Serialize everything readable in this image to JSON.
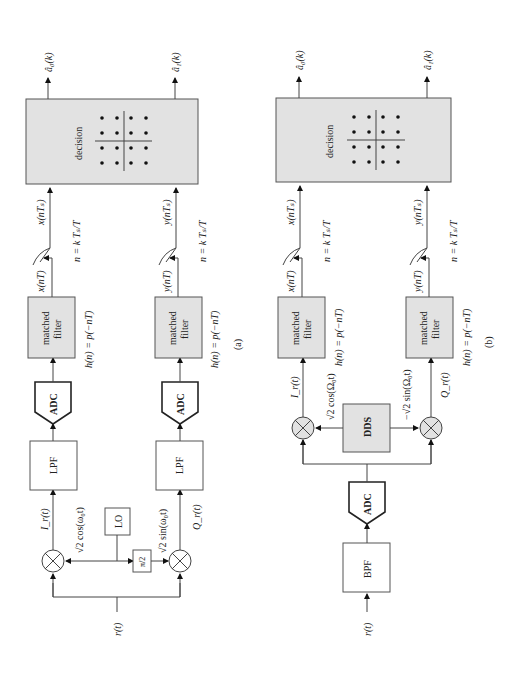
{
  "panel_a": {
    "caption": "(a)",
    "input_label": "r(t)",
    "blocks": {
      "lo": "LO",
      "phase_shift": "π/2",
      "lpf_i": "LPF",
      "lpf_q": "LPF",
      "adc_i": "ADC",
      "adc_q": "ADC",
      "mf_i_line1": "matched",
      "mf_i_line2": "filter",
      "mf_q_line1": "matched",
      "mf_q_line2": "filter",
      "decision": "decision"
    },
    "signals": {
      "i_baseband": "I_r(t)",
      "q_baseband": "Q_r(t)",
      "cos_carrier": "√2 cos(ω₀t)",
      "sin_carrier": "√2 sin(ω₀t)",
      "x_nT": "x(nT)",
      "y_nT": "y(nT)",
      "x_nTs": "x(nTₛ)",
      "y_nTs": "y(nTₛ)",
      "sample_rule_i": "n = k Tₛ/T",
      "sample_rule_q": "n = k Tₛ/T",
      "h_i": "h(n) = p(−nT)",
      "h_q": "h(n) = p(−nT)",
      "out_0": "â₀(k)",
      "out_1": "â₁(k)"
    }
  },
  "panel_b": {
    "caption": "(b)",
    "input_label": "r(t)",
    "blocks": {
      "bpf": "BPF",
      "adc": "ADC",
      "dds": "DDS",
      "mf_i_line1": "matched",
      "mf_i_line2": "filter",
      "mf_q_line1": "matched",
      "mf_q_line2": "filter",
      "decision": "decision"
    },
    "signals": {
      "i_baseband": "I_r(t)",
      "q_baseband": "Q_r(t)",
      "cos_carrier": "√2 cos(Ω₀t)",
      "sin_carrier": "−√2 sin(Ω₀t)",
      "x_nT": "x(nT)",
      "y_nT": "y(nT)",
      "x_nTs": "x(nTₛ)",
      "y_nTs": "y(nTₛ)",
      "sample_rule_i": "n = k Tₛ/T",
      "sample_rule_q": "n = k Tₛ/T",
      "h_i": "h(n) = p(−nT)",
      "h_q": "h(n) = p(−nT)",
      "out_0": "â₀(k)",
      "out_1": "â₁(k)"
    }
  },
  "constellation": {
    "rows": 4,
    "cols": 4,
    "type": "16-QAM"
  }
}
